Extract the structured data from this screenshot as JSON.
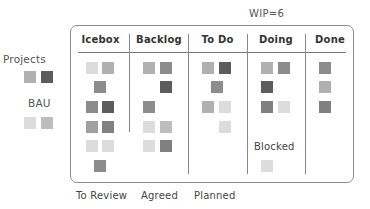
{
  "wip_label": "WIP=6",
  "legend": {
    "projects": {
      "label": "Projects",
      "swatches": [
        "#b0b0b0",
        "#5c5c5c"
      ]
    },
    "bau": {
      "label": "BAU",
      "swatches": [
        "#dcdcdc",
        "#bdbdbd"
      ]
    }
  },
  "columns": [
    {
      "title": "Icebox"
    },
    {
      "title": "Backlog"
    },
    {
      "title": "To Do"
    },
    {
      "title": "Doing"
    },
    {
      "title": "Done"
    }
  ],
  "blocked_label": "Blocked",
  "footer": {
    "to_review": "To Review",
    "agreed": "Agreed",
    "planned": "Planned"
  },
  "colors": {
    "border": "#8a8a8a",
    "card_light": "#dcdcdc",
    "card_mid_light": "#bdbdbd",
    "card_mid": "#a8a8a8",
    "card_mid_dark": "#8c8c8c",
    "card_dark": "#5c5c5c"
  }
}
